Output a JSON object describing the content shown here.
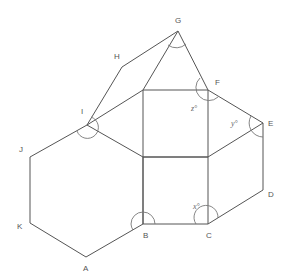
{
  "diagram": {
    "vertices": {
      "A": {
        "label": "A",
        "x": 86,
        "y": 257
      },
      "B": {
        "label": "B",
        "x": 143,
        "y": 224
      },
      "C": {
        "label": "C",
        "x": 208,
        "y": 224
      },
      "D": {
        "label": "D",
        "x": 263,
        "y": 190
      },
      "E": {
        "label": "E",
        "x": 263,
        "y": 123
      },
      "F": {
        "label": "F",
        "x": 208,
        "y": 90
      },
      "G": {
        "label": "G",
        "x": 178,
        "y": 31
      },
      "H": {
        "label": "H",
        "x": 122,
        "y": 67
      },
      "I": {
        "label": "I",
        "x": 87,
        "y": 125
      },
      "J": {
        "label": "J",
        "x": 30,
        "y": 157
      },
      "K": {
        "label": "K",
        "x": 30,
        "y": 223
      }
    },
    "angle_labels": {
      "x": "x°",
      "y": "y°",
      "z": "z°"
    },
    "stroke_color": "#555555",
    "background": "#ffffff"
  }
}
